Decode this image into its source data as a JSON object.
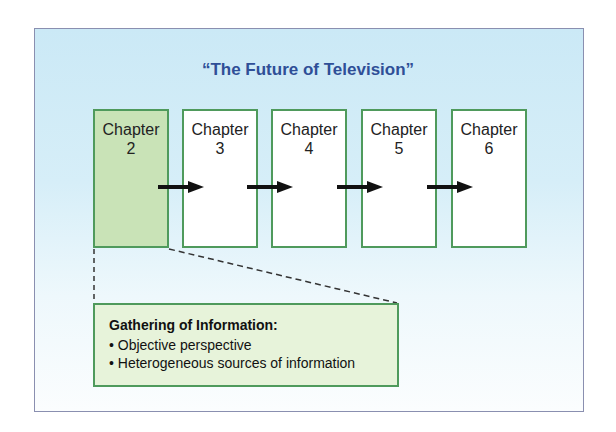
{
  "diagram": {
    "title": "“The Future of Television”",
    "chapters": [
      {
        "label": "Chapter",
        "number": "2",
        "highlighted": true
      },
      {
        "label": "Chapter",
        "number": "3",
        "highlighted": false
      },
      {
        "label": "Chapter",
        "number": "4",
        "highlighted": false
      },
      {
        "label": "Chapter",
        "number": "5",
        "highlighted": false
      },
      {
        "label": "Chapter",
        "number": "6",
        "highlighted": false
      }
    ],
    "callout": {
      "title": "Gathering of Information:",
      "items": [
        "• Objective perspective",
        "• Heterogeneous sources of information"
      ]
    },
    "colors": {
      "title": "#2f4f97",
      "box_border": "#4f9a5c",
      "highlight_fill": "#c9e3b7",
      "callout_fill": "#e7f3da",
      "background_top": "#cbe9f6"
    }
  }
}
